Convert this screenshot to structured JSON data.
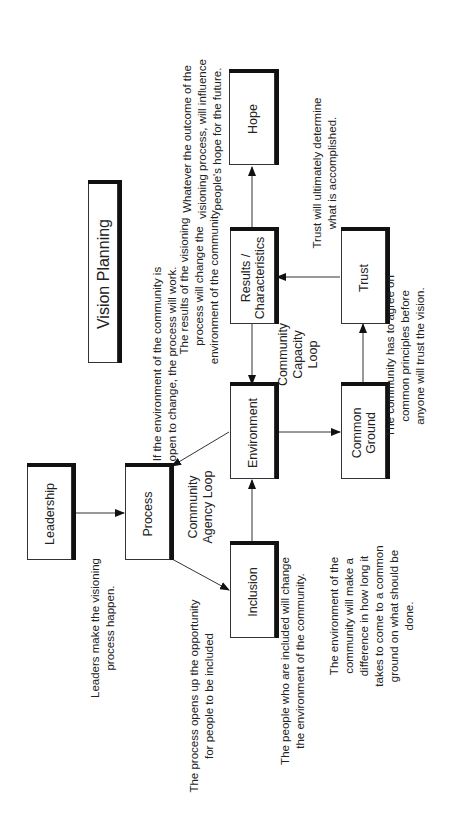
{
  "title": "Vision Planning",
  "nodes": {
    "leadership": "Leadership",
    "process": "Process",
    "inclusion": "Inclusion",
    "environment": "Environment",
    "results": [
      "Results /",
      "Characteristics"
    ],
    "hope": "Hope",
    "common_ground": [
      "Common",
      "Ground"
    ],
    "trust": "Trust"
  },
  "loops": {
    "agency": [
      "Community",
      "Agency Loop"
    ],
    "capacity": [
      "Community",
      "Capacity",
      "Loop"
    ]
  },
  "notes": {
    "leadership": [
      "Leaders make the visioning",
      "process happen."
    ],
    "process": [
      "The process opens up the opportunity",
      "for people to be included"
    ],
    "inclusion": [
      "The people who are included will change",
      "the environment of the community."
    ],
    "environment_process": [
      "If the environment of the community is",
      "open to change, the process will work."
    ],
    "results": [
      "The results of the visioning",
      "process will change the",
      "environment of the community."
    ],
    "hope": [
      "Whatever the outcome of the",
      "visioning process, will influence",
      "people's hope for the future."
    ],
    "trust": [
      "Trust will ultimately determine",
      "what is accomplished."
    ],
    "common_ground": [
      "The community has to agree on",
      "common principles before",
      "anyone will trust the vision."
    ],
    "environment_common": [
      "The environment of the",
      "community will make a",
      "difference in how long it",
      "takes to come to a common",
      "ground on what should be",
      "done."
    ]
  },
  "edges": [
    {
      "from": "Leadership",
      "to": "Process"
    },
    {
      "from": "Process",
      "to": "Inclusion"
    },
    {
      "from": "Inclusion",
      "to": "Environment"
    },
    {
      "from": "Environment",
      "to": "Process"
    },
    {
      "from": "Results / Characteristics",
      "to": "Environment"
    },
    {
      "from": "Results / Characteristics",
      "to": "Hope"
    },
    {
      "from": "Environment",
      "to": "Common Ground"
    },
    {
      "from": "Common Ground",
      "to": "Trust"
    },
    {
      "from": "Trust",
      "to": "Results / Characteristics"
    }
  ]
}
